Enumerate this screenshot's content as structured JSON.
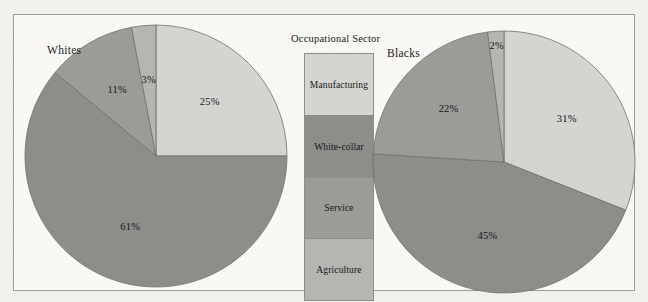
{
  "figure": {
    "background_color": "#fbfaf7",
    "frame_color": "#9a9a96"
  },
  "legend": {
    "title": "Occupational Sector",
    "position": "center",
    "items": [
      {
        "label": "Manufacturing",
        "color": "#d4d4d0",
        "height_px": 62
      },
      {
        "label": "White-collar",
        "color": "#8d8d8a",
        "height_px": 62
      },
      {
        "label": "Service",
        "color": "#9b9b98",
        "height_px": 62
      },
      {
        "label": "Agriculture",
        "color": "#b5b5b1",
        "height_px": 62
      }
    ]
  },
  "chart_data": [
    {
      "type": "pie",
      "title": "Whites",
      "categories": [
        "Manufacturing",
        "White-collar",
        "Service",
        "Agriculture"
      ],
      "values": [
        25,
        61,
        11,
        3
      ],
      "labels": [
        "25%",
        "61%",
        "11%",
        "3%"
      ],
      "colors": [
        "#d4d4d0",
        "#8d8d8a",
        "#9b9b98",
        "#b5b5b1"
      ],
      "start_angle_deg": 0,
      "direction": "clockwise",
      "units": "percent",
      "center": {
        "x": 152,
        "y": 152
      },
      "radius": 131
    },
    {
      "type": "pie",
      "title": "Blacks",
      "categories": [
        "Manufacturing",
        "White-collar",
        "Service",
        "Agriculture"
      ],
      "values": [
        31,
        45,
        22,
        2
      ],
      "labels": [
        "31%",
        "45%",
        "22%",
        "2%"
      ],
      "colors": [
        "#d4d4d0",
        "#8d8d8a",
        "#9b9b98",
        "#b5b5b1"
      ],
      "start_angle_deg": 0,
      "direction": "clockwise",
      "units": "percent",
      "center": {
        "x": 500,
        "y": 158
      },
      "radius": 131
    }
  ]
}
